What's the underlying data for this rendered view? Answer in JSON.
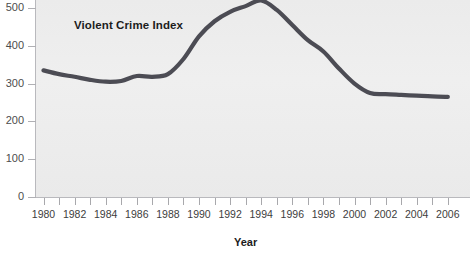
{
  "chart_data": {
    "type": "line",
    "title": "",
    "series_label": "Violent Crime Index",
    "xlabel": "Year",
    "ylabel": "",
    "grid": false,
    "legend_position": "inline-annotation",
    "line_color": "#4c4c54",
    "plot_background": "#ededed",
    "page_background": "#ffffff",
    "ylim": [
      0,
      520
    ],
    "yticks": [
      0,
      100,
      200,
      300,
      400,
      500
    ],
    "ytick_labels": [
      "0",
      "100",
      "200",
      "300",
      "400",
      "500"
    ],
    "xlim": [
      1980,
      2006
    ],
    "xticks": [
      1980,
      1981,
      1982,
      1983,
      1984,
      1985,
      1986,
      1987,
      1988,
      1989,
      1990,
      1991,
      1992,
      1993,
      1994,
      1995,
      1996,
      1997,
      1998,
      1999,
      2000,
      2001,
      2002,
      2003,
      2004,
      2005,
      2006
    ],
    "xtick_labels": [
      "1980",
      "1982",
      "1984",
      "1986",
      "1988",
      "1990",
      "1992",
      "1994",
      "1996",
      "1998",
      "2000",
      "2002",
      "2004",
      "2006"
    ],
    "xtick_label_years": [
      1980,
      1982,
      1984,
      1986,
      1988,
      1990,
      1992,
      1994,
      1996,
      1998,
      2000,
      2002,
      2004,
      2006
    ],
    "x": [
      1980,
      1981,
      1982,
      1983,
      1984,
      1985,
      1986,
      1987,
      1988,
      1989,
      1990,
      1991,
      1992,
      1993,
      1994,
      1995,
      1996,
      1997,
      1998,
      1999,
      2000,
      2001,
      2002,
      2003,
      2004,
      2005,
      2006
    ],
    "values": [
      335,
      325,
      318,
      310,
      305,
      307,
      320,
      318,
      325,
      365,
      425,
      465,
      490,
      505,
      520,
      495,
      455,
      415,
      385,
      340,
      300,
      275,
      272,
      270,
      268,
      266,
      265
    ]
  },
  "annotations": {
    "series_label": "Violent Crime Index",
    "axis_title": "Year"
  }
}
